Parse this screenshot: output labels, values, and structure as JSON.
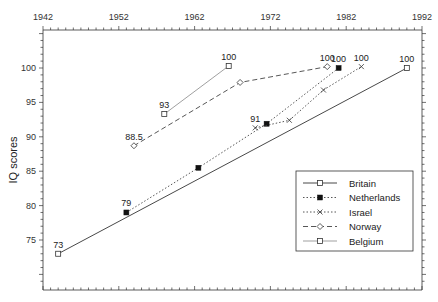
{
  "chart_data": {
    "type": "line",
    "title": "",
    "xlabel": "",
    "ylabel": "IQ scores",
    "xlim": [
      1942,
      1992
    ],
    "ylim": [
      68.5,
      105.5
    ],
    "x_ticks": [
      1942,
      1952,
      1962,
      1972,
      1982,
      1992
    ],
    "x_tick_position": "top",
    "y_ticks": [
      75,
      80,
      85,
      90,
      95,
      100
    ],
    "grid": false,
    "legend_position": "lower right (inside)",
    "series": [
      {
        "name": "Britain",
        "line_style": "solid",
        "marker": "open-square",
        "points": [
          [
            1944,
            73
          ],
          [
            1990,
            100
          ]
        ],
        "labels": [
          "73",
          "100"
        ]
      },
      {
        "name": "Netherlands",
        "line_style": "dotted",
        "marker": "filled-square",
        "points": [
          [
            1953,
            79
          ],
          [
            1962.5,
            85.5
          ],
          [
            1971.5,
            91.9
          ],
          [
            1981,
            100
          ]
        ],
        "labels": [
          "79",
          "",
          "",
          "100"
        ]
      },
      {
        "name": "Israel",
        "line_style": "dotted",
        "marker": "x",
        "points": [
          [
            1970,
            91.3
          ],
          [
            1974.5,
            92.4
          ],
          [
            1979,
            96.8
          ],
          [
            1984,
            100.2
          ]
        ],
        "labels": [
          "91",
          "",
          "",
          "100"
        ]
      },
      {
        "name": "Norway",
        "line_style": "dashed",
        "marker": "open-diamond",
        "points": [
          [
            1954,
            88.7
          ],
          [
            1968,
            97.9
          ],
          [
            1979.5,
            100.2
          ]
        ],
        "labels": [
          "88.5",
          "",
          "100"
        ]
      },
      {
        "name": "Belgium",
        "line_style": "solid-thin",
        "marker": "open-square",
        "points": [
          [
            1958,
            93.3
          ],
          [
            1966.5,
            100.3
          ]
        ],
        "labels": [
          "93",
          "100"
        ]
      }
    ]
  },
  "legend": {
    "items": [
      "Britain",
      "Netherlands",
      "Israel",
      "Norway",
      "Belgium"
    ]
  },
  "axis": {
    "ylabel": "IQ scores",
    "x_tick_labels": [
      "1942",
      "1952",
      "1962",
      "1972",
      "1982",
      "1992"
    ],
    "y_tick_labels": [
      "75",
      "80",
      "85",
      "90",
      "95",
      "100"
    ]
  }
}
